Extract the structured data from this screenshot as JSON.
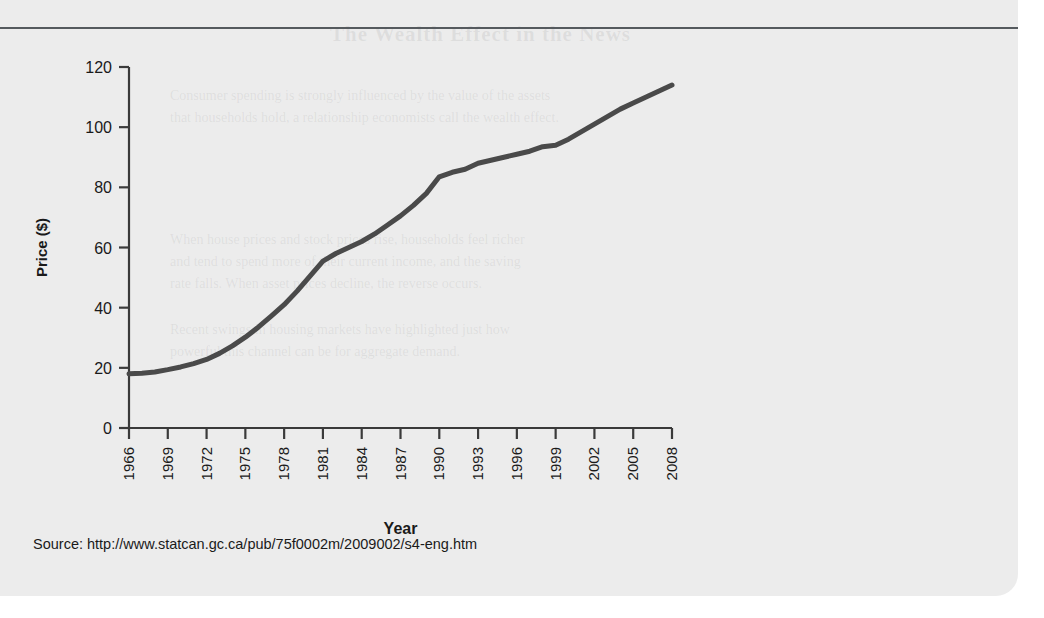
{
  "page": {
    "background_color": "#ececec",
    "rule_color": "#555a5e"
  },
  "ghost_text": {
    "title": "The Wealth Effect in the News",
    "lines": [
      "Consumer spending is strongly influenced by the value of the assets",
      "that households hold, a relationship economists call the wealth effect.",
      "",
      "When house prices and stock prices rise, households feel richer",
      "and tend to spend more of their current income, and the saving",
      "rate falls. When asset prices decline, the reverse occurs.",
      "",
      "Recent swings in housing markets have highlighted just how",
      "powerful this channel can be for aggregate demand."
    ]
  },
  "chart_data": {
    "type": "line",
    "title": "",
    "subtitle": "",
    "xlabel": "Year",
    "ylabel": "Price ($)",
    "xlim": [
      1966,
      2008
    ],
    "ylim": [
      0,
      120
    ],
    "yticks": [
      0,
      20,
      40,
      60,
      80,
      100,
      120
    ],
    "xticks": [
      1966,
      1969,
      1972,
      1975,
      1978,
      1981,
      1984,
      1987,
      1990,
      1993,
      1996,
      1999,
      2002,
      2005,
      2008
    ],
    "grid": false,
    "legend": false,
    "legend_position": "none",
    "line_color": "#4a4a4a",
    "line_width": 5,
    "series": [
      {
        "name": "Price ($)",
        "x": [
          1966,
          1967,
          1968,
          1969,
          1970,
          1971,
          1972,
          1973,
          1974,
          1975,
          1976,
          1977,
          1978,
          1979,
          1980,
          1981,
          1982,
          1983,
          1984,
          1985,
          1986,
          1987,
          1988,
          1989,
          1990,
          1991,
          1992,
          1993,
          1994,
          1995,
          1996,
          1997,
          1998,
          1999,
          2000,
          2001,
          2002,
          2003,
          2004,
          2005,
          2006,
          2007,
          2008
        ],
        "values": [
          18,
          18.2,
          18.6,
          19.4,
          20.3,
          21.4,
          22.8,
          24.8,
          27.3,
          30.2,
          33.5,
          37.2,
          41.0,
          45.5,
          50.5,
          55.5,
          58.0,
          60.0,
          62.0,
          64.5,
          67.5,
          70.5,
          74.0,
          78.0,
          83.5,
          85.0,
          86.0,
          88.0,
          89.0,
          90.0,
          91.0,
          92.0,
          93.5,
          94.0,
          96.0,
          98.5,
          101.0,
          103.5,
          106.0,
          108.0,
          110.0,
          112.0,
          114.0
        ]
      }
    ]
  },
  "source": {
    "label": "Source: http://www.statcan.gc.ca/pub/75f0002m/2009002/s4-eng.htm"
  }
}
